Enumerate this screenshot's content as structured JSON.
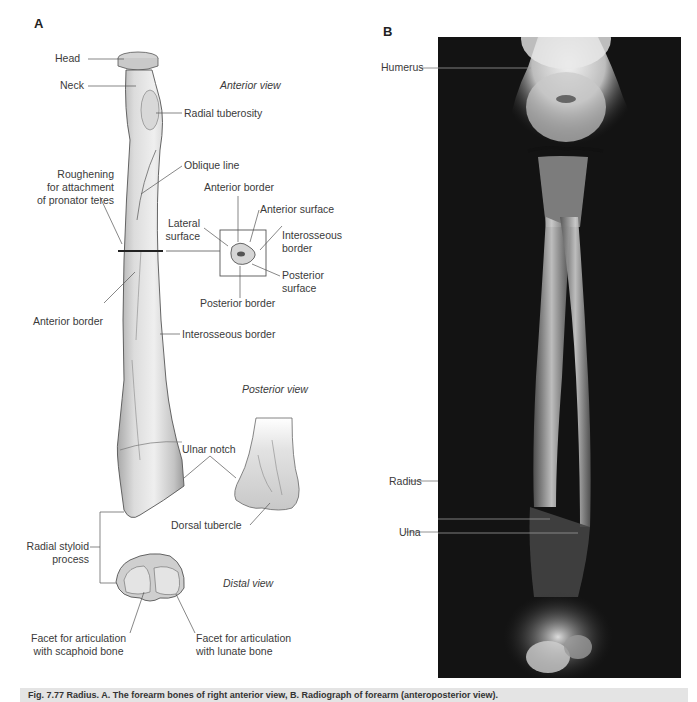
{
  "panel_a": {
    "letter": "A",
    "views": {
      "anterior": "Anterior view",
      "posterior": "Posterior view",
      "distal": "Distal view"
    },
    "labels": {
      "head": "Head",
      "neck": "Neck",
      "radial_tuberosity": "Radial tuberosity",
      "oblique_line": "Oblique line",
      "roughening": "Roughening\nfor attachment\nof pronator teres",
      "anterior_border_inset": "Anterior border",
      "anterior_surface": "Anterior surface",
      "lateral_surface": "Lateral\nsurface",
      "interosseous_border_inset": "Interosseous\nborder",
      "posterior_surface": "Posterior\nsurface",
      "posterior_border": "Posterior border",
      "anterior_border": "Anterior border",
      "interosseous_border": "Interosseous border",
      "ulnar_notch": "Ulnar notch",
      "dorsal_tubercle": "Dorsal tubercle",
      "radial_styloid": "Radial styloid\nprocess",
      "facet_scaphoid": "Facet for articulation\nwith scaphoid bone",
      "facet_lunate": "Facet for articulation\nwith lunate bone"
    }
  },
  "panel_b": {
    "letter": "B",
    "labels": {
      "humerus": "Humerus",
      "radius": "Radius",
      "ulna": "Ulna"
    }
  },
  "caption": {
    "text": "Fig. 7.77 Radius. A. The forearm bones of right anterior view, B. Radiograph of forearm (anteroposterior view)."
  }
}
